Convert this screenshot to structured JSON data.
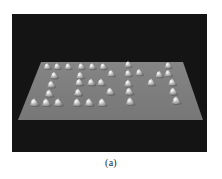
{
  "figure": {
    "caption": "(a)",
    "word": "IBM",
    "colors": {
      "background": "#141414",
      "surface": "#7e7e7e",
      "atom": "#c8c8c8",
      "atom_highlight": "#f0f0f0"
    },
    "surface_polygon": [
      [
        41,
        62
      ],
      [
        183,
        62
      ],
      [
        203,
        120
      ],
      [
        18,
        120
      ]
    ],
    "atoms": {
      "I": [
        [
          47,
          66
        ],
        [
          57,
          66
        ],
        [
          68,
          66
        ],
        [
          54,
          75
        ],
        [
          51,
          84
        ],
        [
          49,
          93
        ],
        [
          34,
          102
        ],
        [
          46,
          102
        ],
        [
          58,
          102
        ]
      ],
      "B": [
        [
          81,
          66
        ],
        [
          92,
          66
        ],
        [
          103,
          66
        ],
        [
          80,
          75
        ],
        [
          111,
          73
        ],
        [
          79,
          82
        ],
        [
          91,
          82
        ],
        [
          101,
          82
        ],
        [
          78,
          92
        ],
        [
          110,
          91
        ],
        [
          77,
          102
        ],
        [
          89,
          102
        ],
        [
          102,
          102
        ]
      ],
      "M": [
        [
          128,
          64
        ],
        [
          128,
          73
        ],
        [
          128,
          83
        ],
        [
          129,
          91
        ],
        [
          130,
          101
        ],
        [
          139,
          72
        ],
        [
          151,
          82
        ],
        [
          159,
          74
        ],
        [
          168,
          73
        ],
        [
          168,
          65
        ],
        [
          172,
          82
        ],
        [
          173,
          91
        ],
        [
          176,
          100
        ]
      ]
    }
  }
}
